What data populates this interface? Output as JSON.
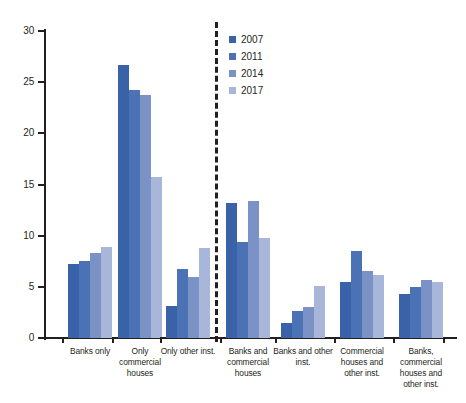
{
  "chart_data": {
    "type": "bar",
    "title": "",
    "subtitle": "",
    "xlabel": "",
    "ylabel": "",
    "ylim": [
      0,
      30
    ],
    "yticks": [
      0,
      5,
      10,
      15,
      20,
      25,
      30
    ],
    "grid": false,
    "legend_position": "top-center-right",
    "categories": [
      "Banks only",
      "Only commercial houses",
      "Only other inst.",
      "Banks and commercial houses",
      "Banks and other inst.",
      "Commercial houses and other inst.",
      "Banks, commercial houses and other inst."
    ],
    "series": [
      {
        "name": "2007",
        "color": "#3a62a8",
        "values": [
          7.2,
          26.7,
          3.1,
          13.2,
          1.5,
          5.5,
          4.3
        ]
      },
      {
        "name": "2011",
        "color": "#4a72b4",
        "values": [
          7.5,
          24.2,
          6.7,
          9.4,
          2.6,
          8.5,
          5.0
        ]
      },
      {
        "name": "2014",
        "color": "#7b92c6",
        "values": [
          8.3,
          23.7,
          6.0,
          13.4,
          3.0,
          6.5,
          5.7
        ]
      },
      {
        "name": "2017",
        "color": "#a8b7d9",
        "values": [
          8.9,
          15.7,
          8.8,
          9.8,
          5.1,
          6.2,
          5.5
        ]
      }
    ],
    "annotations": {
      "divider": {
        "type": "vertical-dashed-line",
        "after_category": "Only other inst."
      }
    }
  }
}
